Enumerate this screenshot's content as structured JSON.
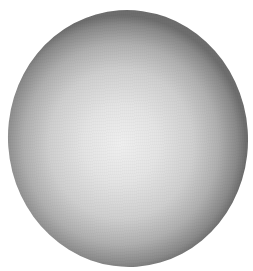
{
  "image": {
    "subject": "grayscale sphere",
    "background_color": "#ffffff",
    "colors": {
      "center": "#efefef",
      "mid": "#cfcfcf",
      "rim": "#6e6e6e"
    }
  }
}
